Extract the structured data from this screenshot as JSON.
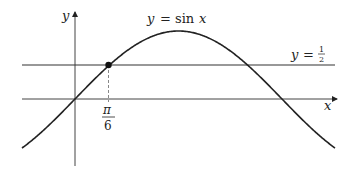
{
  "diagram": {
    "curve_label_lhs": "y",
    "curve_label_eq": "=",
    "curve_label_fn": "sin",
    "curve_label_var": "x",
    "line_label_lhs": "y",
    "line_label_eq": "=",
    "line_label_num": "1",
    "line_label_den": "2",
    "x_axis_label": "x",
    "y_axis_label": "y",
    "tick_num": "π",
    "tick_den": "6",
    "colors": {
      "stroke": "#222222",
      "dashed": "#888888"
    }
  }
}
